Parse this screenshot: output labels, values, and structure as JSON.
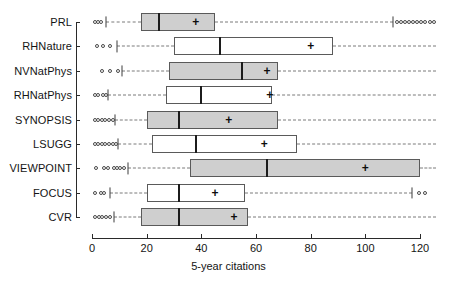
{
  "chart_data": {
    "type": "box",
    "title": "",
    "xlabel": "5-year citations",
    "ylabel": "",
    "xlim": [
      0,
      126
    ],
    "xticks": [
      0,
      20,
      40,
      60,
      80,
      100,
      120
    ],
    "xtick_labels": [
      "0",
      "20",
      "40",
      "60",
      "80",
      "100",
      "120"
    ],
    "grid": false,
    "orientation": "horizontal",
    "legend": "none",
    "categories": [
      "PRL",
      "RHNature",
      "NVNatPhys",
      "RHNatPhys",
      "SYNOPSIS",
      "LSUGG",
      "VIEWPOINT",
      "FOCUS",
      "CVR"
    ],
    "boxes": [
      {
        "category": "PRL",
        "fill": "gray",
        "whisker_low": 5.0,
        "q1": 18.0,
        "median": 24.5,
        "q3": 45.0,
        "whisker_high": 110.0,
        "mean": 38.0,
        "outliers_low": [
          1.0,
          2.2,
          3.4
        ],
        "outliers_high": [
          111.5,
          113.0,
          114.5,
          116.0,
          117.5,
          119.0,
          120.5,
          122.0,
          123.5,
          125.0
        ]
      },
      {
        "category": "RHNature",
        "fill": "white",
        "whisker_low": 9.0,
        "q1": 30.0,
        "median": 47.0,
        "q3": 88.0,
        "whisker_high": 126.0,
        "mean": 80.0,
        "outliers_low": [
          2.0,
          4.0,
          6.5
        ],
        "outliers_high": []
      },
      {
        "category": "NVNatPhys",
        "fill": "gray",
        "whisker_low": 11.0,
        "q1": 28.0,
        "median": 55.0,
        "q3": 68.0,
        "whisker_high": 126.0,
        "mean": 64.0,
        "outliers_low": [
          3.5,
          6.5,
          9.5
        ],
        "outliers_high": []
      },
      {
        "category": "RHNatPhys",
        "fill": "white",
        "whisker_low": 6.0,
        "q1": 27.0,
        "median": 40.0,
        "q3": 66.0,
        "whisker_high": 126.0,
        "mean": 65.0,
        "outliers_low": [
          1.0,
          2.3,
          4.0,
          5.2
        ],
        "outliers_high": []
      },
      {
        "category": "SYNOPSIS",
        "fill": "gray",
        "whisker_low": 8.5,
        "q1": 20.0,
        "median": 32.0,
        "q3": 68.0,
        "whisker_high": 126.0,
        "mean": 50.0,
        "outliers_low": [
          1.0,
          2.3,
          3.6,
          4.9,
          6.2,
          7.5
        ],
        "outliers_high": []
      },
      {
        "category": "LSUGG",
        "fill": "white",
        "whisker_low": 9.5,
        "q1": 22.0,
        "median": 38.0,
        "q3": 75.0,
        "whisker_high": 126.0,
        "mean": 63.0,
        "outliers_low": [
          1.0,
          2.3,
          3.6,
          4.9,
          6.2,
          7.5,
          8.6
        ],
        "outliers_high": []
      },
      {
        "category": "VIEWPOINT",
        "fill": "gray",
        "whisker_low": 13.0,
        "q1": 36.0,
        "median": 64.0,
        "q3": 120.0,
        "whisker_high": 126.0,
        "mean": 100.0,
        "outliers_low": [
          1.5,
          4.5,
          6.0,
          8.0,
          9.2,
          10.4,
          11.6
        ],
        "outliers_high": []
      },
      {
        "category": "FOCUS",
        "fill": "white",
        "whisker_low": 6.5,
        "q1": 20.0,
        "median": 32.0,
        "q3": 56.0,
        "whisker_high": 117.0,
        "mean": 45.0,
        "outliers_low": [
          1.2,
          3.2,
          4.5
        ],
        "outliers_high": [
          119.5,
          122.0
        ]
      },
      {
        "category": "CVR",
        "fill": "gray",
        "whisker_low": 8.0,
        "q1": 18.0,
        "median": 32.0,
        "q3": 57.0,
        "whisker_high": 126.0,
        "mean": 52.0,
        "outliers_low": [
          1.0,
          2.4,
          3.8,
          5.2,
          6.5
        ],
        "outliers_high": []
      }
    ],
    "colors": {
      "box_gray_fill": "#cfcfcf",
      "box_white_fill": "#ffffff",
      "box_border": "#5a5a5a",
      "median_line": "#1c1c1c",
      "whisker": "#7a7a7a",
      "axis": "#2a2a2a",
      "text": "#141414"
    },
    "mean_marker": "+"
  }
}
